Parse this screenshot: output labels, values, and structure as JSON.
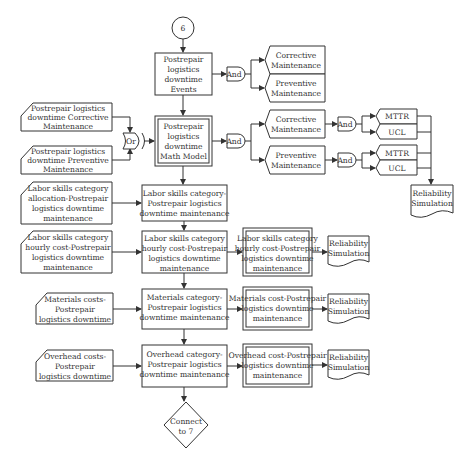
{
  "diagram": {
    "start_connector": "6",
    "end_connector": [
      "Connect",
      "to 7"
    ],
    "events_box": [
      "Postrepair",
      "logistics",
      "downtime",
      "Events"
    ],
    "events_gate": "And",
    "events_outputs": [
      [
        "Corrective",
        "Maintenance"
      ],
      [
        "Preventive",
        "Maintenance"
      ]
    ],
    "inputs_corrective": [
      "Postrepair logistics",
      "downtime Corrective",
      "Maintenance"
    ],
    "inputs_preventive": [
      "Postrepair logistics",
      "downtime Preventive",
      "Maintenance"
    ],
    "or_gate": "Or",
    "math_model": [
      "Postrepair",
      "logistics",
      "downtime",
      "Math Model"
    ],
    "math_gate": "And",
    "math_outputs": [
      {
        "label": [
          "Corrective",
          "Maintenance"
        ],
        "gate": "And",
        "results": [
          "MTTR",
          "UCL"
        ]
      },
      {
        "label": [
          "Preventive",
          "Maintenance"
        ],
        "gate": "And",
        "results": [
          "MTTR",
          "UCL"
        ]
      }
    ],
    "reliability_top": [
      "Reliability",
      "Simulation"
    ],
    "rows": [
      {
        "input": [
          "Labor skills category",
          "allocation-Postrepair",
          "logistics downtime",
          "maintenance"
        ],
        "process": [
          "Labor skills category-",
          "Postrepair logistics",
          "downtime maintenance"
        ]
      },
      {
        "input": [
          "Labor skills category",
          "hourly cost-Postrepair",
          "logistics downtime",
          "maintenance"
        ],
        "process": [
          "Labor skills category",
          "hourly cost-Postrepair",
          "logistics downtime",
          "maintenance"
        ],
        "output": [
          "Labor skills category",
          "hourly cost-Postrepair",
          "logistics downtime",
          "maintenance"
        ],
        "doc": [
          "Reliability",
          "Simulation"
        ]
      },
      {
        "input": [
          "Materials costs-",
          "Postrepair",
          "logistics downtime"
        ],
        "process": [
          "Materials category-",
          "Postrepair logistics",
          "downtime maintenance"
        ],
        "output": [
          "Materials cost-Postrepair",
          "logistics downtime",
          "maintenance"
        ],
        "doc": [
          "Reliability",
          "Simulation"
        ]
      },
      {
        "input": [
          "Overhead costs-",
          "Postrepair",
          "logistics downtime"
        ],
        "process": [
          "Overhead category-",
          "Postrepair logistics",
          "downtime maintenance"
        ],
        "output": [
          "Overhead cost-Postrepair",
          "logistics downtime",
          "maintenance"
        ],
        "doc": [
          "Reliability",
          "Simulation"
        ]
      }
    ]
  }
}
